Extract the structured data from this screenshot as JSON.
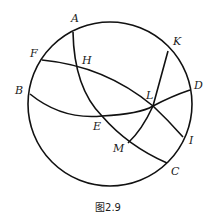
{
  "figure": {
    "caption": "图2.9",
    "circle": {
      "cx": 110,
      "cy": 104,
      "r": 82
    },
    "points": {
      "A": {
        "label": "A",
        "x": 73,
        "y": 32,
        "lx": 71,
        "ly": 22
      },
      "K": {
        "label": "K",
        "x": 168,
        "y": 51,
        "lx": 173,
        "ly": 45
      },
      "F": {
        "label": "F",
        "x": 42,
        "y": 60,
        "lx": 30,
        "ly": 57
      },
      "B": {
        "label": "B",
        "x": 30,
        "y": 94,
        "lx": 15,
        "ly": 94
      },
      "D": {
        "label": "D",
        "x": 190,
        "y": 90,
        "lx": 194,
        "ly": 89
      },
      "I": {
        "label": "I",
        "x": 183,
        "y": 137,
        "lx": 189,
        "ly": 144
      },
      "C": {
        "label": "C",
        "x": 167,
        "y": 163,
        "lx": 171,
        "ly": 175
      },
      "H": {
        "label": "H",
        "x": 78,
        "y": 67,
        "lx": 82,
        "ly": 64
      },
      "L": {
        "label": "L",
        "x": 153,
        "y": 106,
        "lx": 146,
        "ly": 99
      },
      "E": {
        "label": "E",
        "x": 102,
        "y": 116,
        "lx": 93,
        "ly": 130
      },
      "M": {
        "label": "M",
        "x": 128,
        "y": 143,
        "lx": 113,
        "ly": 152
      }
    },
    "arcs": [
      {
        "name": "arc-AHEC",
        "through": [
          "A",
          "H",
          "E",
          "C"
        ]
      },
      {
        "name": "arc-FHLI",
        "through": [
          "F",
          "H",
          "L",
          "I"
        ]
      },
      {
        "name": "arc-BELD",
        "through": [
          "B",
          "E",
          "L",
          "D"
        ]
      },
      {
        "name": "arc-KLM",
        "through": [
          "K",
          "L",
          "M"
        ]
      }
    ]
  }
}
